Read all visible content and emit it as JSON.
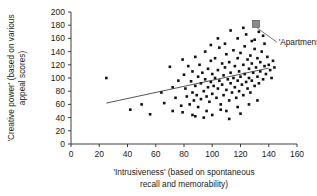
{
  "chart_data": {
    "type": "scatter",
    "title": "",
    "xlabel": "'Intrusiveness' (based on spontaneous recall and memorability)",
    "xlabel_line1": "'Intrusiveness' (based on spontaneous",
    "xlabel_line2": "recall and memorability)",
    "ylabel": "'Creative power' (based on various appeal scores)",
    "ylabel_line1": "'Creative power' (based on various",
    "ylabel_line2": "appeal scores)",
    "xlim": [
      0,
      160
    ],
    "ylim": [
      0,
      200
    ],
    "xticks": [
      0,
      20,
      40,
      60,
      80,
      100,
      120,
      140,
      160
    ],
    "yticks": [
      0,
      20,
      40,
      60,
      80,
      100,
      120,
      140,
      160,
      180,
      200
    ],
    "grid": false,
    "legend": null,
    "marker_color": "#111111",
    "annotations": [
      {
        "label": "'Apartment'",
        "x": 131,
        "y": 182,
        "marker": "square",
        "marker_color": "#8a8a8a",
        "label_x": 147,
        "label_y": 150
      }
    ],
    "trendline": {
      "x": [
        25,
        140
      ],
      "y": [
        62,
        115
      ]
    },
    "points": [
      [
        25,
        100
      ],
      [
        42,
        52
      ],
      [
        50,
        60
      ],
      [
        56,
        45
      ],
      [
        64,
        78
      ],
      [
        66,
        62
      ],
      [
        70,
        117
      ],
      [
        72,
        86
      ],
      [
        74,
        70
      ],
      [
        76,
        96
      ],
      [
        78,
        58
      ],
      [
        79,
        128
      ],
      [
        80,
        105
      ],
      [
        81,
        84
      ],
      [
        82,
        72
      ],
      [
        83,
        118
      ],
      [
        84,
        60
      ],
      [
        85,
        95
      ],
      [
        86,
        110
      ],
      [
        86,
        78
      ],
      [
        87,
        66
      ],
      [
        88,
        132
      ],
      [
        88,
        88
      ],
      [
        89,
        74
      ],
      [
        90,
        102
      ],
      [
        90,
        56
      ],
      [
        91,
        120
      ],
      [
        92,
        92
      ],
      [
        92,
        68
      ],
      [
        93,
        108
      ],
      [
        94,
        80
      ],
      [
        95,
        140
      ],
      [
        95,
        98
      ],
      [
        96,
        72
      ],
      [
        97,
        114
      ],
      [
        97,
        86
      ],
      [
        98,
        64
      ],
      [
        99,
        126
      ],
      [
        99,
        94
      ],
      [
        100,
        106
      ],
      [
        100,
        76
      ],
      [
        101,
        88
      ],
      [
        102,
        130
      ],
      [
        102,
        100
      ],
      [
        103,
        70
      ],
      [
        104,
        112
      ],
      [
        104,
        84
      ],
      [
        105,
        146
      ],
      [
        105,
        96
      ],
      [
        106,
        60
      ],
      [
        107,
        122
      ],
      [
        107,
        90
      ],
      [
        108,
        104
      ],
      [
        108,
        74
      ],
      [
        109,
        116
      ],
      [
        110,
        82
      ],
      [
        110,
        136
      ],
      [
        111,
        98
      ],
      [
        112,
        66
      ],
      [
        112,
        124
      ],
      [
        113,
        92
      ],
      [
        113,
        108
      ],
      [
        114,
        78
      ],
      [
        115,
        142
      ],
      [
        115,
        100
      ],
      [
        116,
        86
      ],
      [
        116,
        118
      ],
      [
        117,
        70
      ],
      [
        118,
        130
      ],
      [
        118,
        96
      ],
      [
        119,
        110
      ],
      [
        119,
        80
      ],
      [
        120,
        102
      ],
      [
        120,
        138
      ],
      [
        121,
        90
      ],
      [
        122,
        120
      ],
      [
        122,
        74
      ],
      [
        123,
        106
      ],
      [
        123,
        148
      ],
      [
        124,
        94
      ],
      [
        125,
        128
      ],
      [
        125,
        84
      ],
      [
        126,
        114
      ],
      [
        126,
        100
      ],
      [
        127,
        134
      ],
      [
        127,
        78
      ],
      [
        128,
        122
      ],
      [
        128,
        96
      ],
      [
        129,
        108
      ],
      [
        130,
        144
      ],
      [
        130,
        88
      ],
      [
        131,
        116
      ],
      [
        132,
        130
      ],
      [
        132,
        102
      ],
      [
        133,
        92
      ],
      [
        134,
        124
      ],
      [
        134,
        110
      ],
      [
        135,
        140
      ],
      [
        136,
        98
      ],
      [
        137,
        118
      ],
      [
        138,
        106
      ],
      [
        139,
        132
      ],
      [
        141,
        112
      ],
      [
        143,
        126
      ],
      [
        112,
        38
      ],
      [
        120,
        46
      ],
      [
        100,
        44
      ],
      [
        88,
        42
      ],
      [
        106,
        52
      ],
      [
        96,
        50
      ],
      [
        130,
        158
      ],
      [
        118,
        160
      ],
      [
        109,
        152
      ],
      [
        124,
        166
      ],
      [
        113,
        172
      ],
      [
        137,
        152
      ],
      [
        140,
        120
      ],
      [
        94,
        40
      ],
      [
        79,
        48
      ],
      [
        72,
        50
      ],
      [
        133,
        170
      ],
      [
        128,
        156
      ],
      [
        104,
        160
      ],
      [
        99,
        150
      ],
      [
        122,
        176
      ],
      [
        136,
        164
      ],
      [
        86,
        44
      ],
      [
        126,
        60
      ],
      [
        132,
        66
      ],
      [
        118,
        56
      ],
      [
        110,
        50
      ],
      [
        142,
        100
      ],
      [
        144,
        116
      ]
    ]
  }
}
